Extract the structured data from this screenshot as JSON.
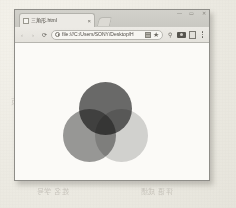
{
  "browser": {
    "tab": {
      "title": "三角形.html",
      "favicon_icon": "page-favicon-icon",
      "close_icon": "×"
    },
    "new_tab_label": "+",
    "window_controls": [
      {
        "name": "minimize",
        "glyph": "—"
      },
      {
        "name": "maximize",
        "glyph": "▭"
      },
      {
        "name": "close",
        "glyph": "✕"
      }
    ],
    "toolbar": {
      "back_glyph": "‹",
      "forward_glyph": "›",
      "reload_glyph": "⟳",
      "url": "file:///C:/Users/SONY/Desktop/H",
      "site_info_icon": "info-circle-icon",
      "save_page_icon": "save-page-icon",
      "bookmark_icon": "★",
      "extension_icon": "⚲",
      "webcam_icon": "webcam-icon",
      "reader_icon": "reader-icon",
      "menu_glyph": "⋮"
    }
  },
  "page": {
    "venn": {
      "title": "three-overlapping-circles",
      "circles": [
        {
          "name": "top",
          "fill": "#6b6b6b",
          "cx": 42.5,
          "cy": 26.5,
          "r": 26.5
        },
        {
          "name": "left",
          "fill": "#9a9a9a",
          "cx": 26.5,
          "cy": 53.5,
          "r": 26.5
        },
        {
          "name": "right",
          "fill": "#d5d5d5",
          "cx": 58.5,
          "cy": 53.5,
          "r": 26.5
        }
      ],
      "background": "#fbfaf7"
    }
  },
  "scan": {
    "paper_color": "#eceae2",
    "ghost_text": [
      "大学 指导",
      "同学 课程设计",
      "图形学 实验",
      "计算机 三角形",
      "提交 日期 2017",
      "学院 软件工程",
      "姓名 学号",
      "评语 成绩",
      "网页",
      "效果",
      "实验报告",
      "教师"
    ]
  }
}
